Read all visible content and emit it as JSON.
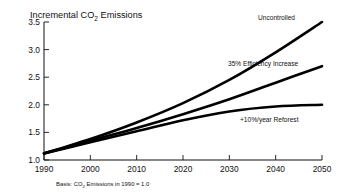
{
  "chart_data": {
    "type": "line",
    "title": "Incremental CO2 Emissions",
    "title_prefix": "Incremental CO",
    "title_subscript": "2",
    "title_suffix": " Emissions",
    "xlabel": "",
    "ylabel": "",
    "xlim": [
      1990,
      2050
    ],
    "ylim": [
      1.0,
      3.5
    ],
    "xticks": [
      "1990",
      "2000",
      "2010",
      "2020",
      "2030",
      "2040",
      "2050"
    ],
    "yticks": [
      "1.0",
      "1.5",
      "2.0",
      "2.5",
      "3.0",
      "3.5"
    ],
    "grid": false,
    "legend_position": "inline-annotations",
    "x": [
      1990,
      2000,
      2010,
      2020,
      2030,
      2040,
      2050
    ],
    "series": [
      {
        "name": "Uncontrolled",
        "values": [
          1.12,
          1.38,
          1.68,
          2.03,
          2.45,
          2.95,
          3.5
        ],
        "color": "#000000",
        "label_x": 2043,
        "label_y": 3.62
      },
      {
        "name": "35% Efficiency Increase",
        "values": [
          1.12,
          1.35,
          1.58,
          1.83,
          2.1,
          2.4,
          2.7
        ],
        "color": "#000000",
        "label_x": 2035,
        "label_y": 2.88
      },
      {
        "name": "+10%/year Reforest",
        "values": [
          1.12,
          1.32,
          1.52,
          1.72,
          1.88,
          1.97,
          2.0
        ],
        "color": "#000000",
        "label_x": 2036,
        "label_y": 1.78
      }
    ],
    "footnote_prefix": "Basis: CO",
    "footnote_subscript": "2",
    "footnote_suffix": " Emissions in 1990 = 1.0",
    "footnote": "Basis: CO2 Emissions in 1990 = 1.0",
    "axis_color": "#111111"
  }
}
